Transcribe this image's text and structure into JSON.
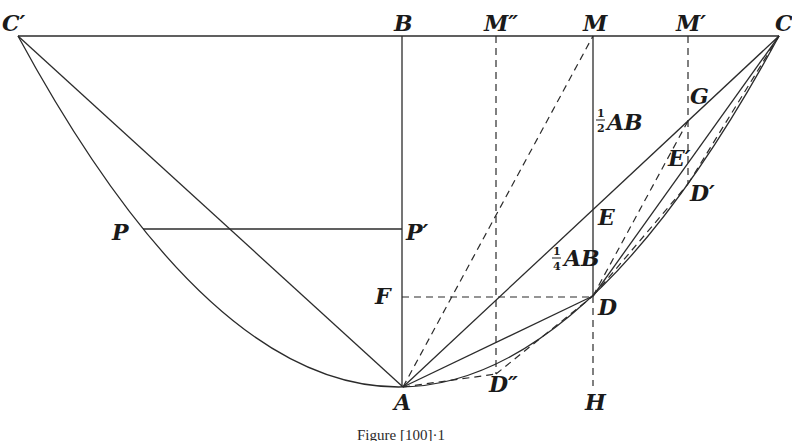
{
  "figure": {
    "caption": "Figure [100]·1",
    "caption_prefix": "Figure",
    "caption_ref": "[100]·1",
    "stroke_color": "#2b2b2b",
    "background": "#ffffff"
  },
  "points": {
    "C_prime": {
      "label": "C′",
      "x": 18,
      "y": 36
    },
    "B": {
      "label": "B",
      "x": 402,
      "y": 36
    },
    "M_dprime": {
      "label": "M″",
      "x": 496,
      "y": 36
    },
    "M": {
      "label": "M",
      "x": 593,
      "y": 36
    },
    "M_prime": {
      "label": "M′",
      "x": 688,
      "y": 36
    },
    "C": {
      "label": "C",
      "x": 779,
      "y": 36
    },
    "G": {
      "label": "G",
      "x": 688,
      "y": 121
    },
    "E_prime": {
      "label": "E′",
      "x": 688,
      "y": 160
    },
    "D_prime": {
      "label": "D′",
      "x": 688,
      "y": 184
    },
    "E": {
      "label": "E",
      "x": 593,
      "y": 210
    },
    "P": {
      "label": "P",
      "x": 143,
      "y": 229
    },
    "P_prime": {
      "label": "P′",
      "x": 402,
      "y": 229
    },
    "F": {
      "label": "F",
      "x": 402,
      "y": 297
    },
    "D": {
      "label": "D",
      "x": 593,
      "y": 296
    },
    "D_dprime": {
      "label": "D″",
      "x": 496,
      "y": 374
    },
    "A": {
      "label": "A",
      "x": 403,
      "y": 387
    },
    "H": {
      "label": "H",
      "x": 593,
      "y": 388
    }
  },
  "annotations": {
    "half_AB": {
      "numerator": "1",
      "denominator": "2",
      "text": "AB"
    },
    "quarter_AB": {
      "numerator": "1",
      "denominator": "4",
      "text": "AB"
    }
  },
  "curves": {
    "parabola": "C′ → A → C (vertex at A)"
  }
}
